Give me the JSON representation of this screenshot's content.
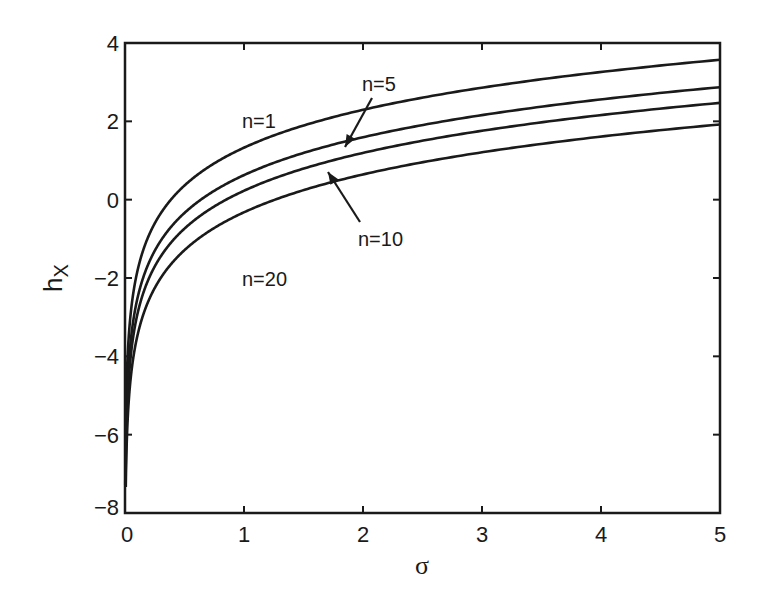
{
  "chart_data": {
    "type": "line",
    "title": "",
    "xlabel": "σ",
    "ylabel": "h_X",
    "ylabel_main": "h",
    "ylabel_sub": "X",
    "xlim": [
      0,
      5
    ],
    "ylim": [
      -8,
      4
    ],
    "xticks": [
      0,
      1,
      2,
      3,
      4,
      5
    ],
    "xtick_labels": [
      "0",
      "1",
      "2",
      "3",
      "4",
      "5"
    ],
    "yticks": [
      -8,
      -6,
      -4,
      -2,
      0,
      2,
      4
    ],
    "ytick_labels": [
      "−8",
      "−6",
      "−4",
      "−2",
      "0",
      "2",
      "4"
    ],
    "grid": false,
    "legend": "none (inline annotations)",
    "series": [
      {
        "name": "n=1",
        "x": [
          0.01,
          0.1,
          0.5,
          1,
          2,
          3,
          4,
          5
        ],
        "values": [
          -5.1,
          -1.9,
          0.4,
          1.35,
          2.3,
          2.85,
          3.25,
          3.55
        ]
      },
      {
        "name": "n=5",
        "x": [
          0.01,
          0.1,
          0.5,
          1,
          2,
          3,
          4,
          5
        ],
        "values": [
          -5.8,
          -2.6,
          -0.3,
          0.65,
          1.6,
          2.15,
          2.55,
          2.85
        ]
      },
      {
        "name": "n=10",
        "x": [
          0.01,
          0.1,
          0.5,
          1,
          2,
          3,
          4,
          5
        ],
        "values": [
          -6.2,
          -3.0,
          -0.7,
          0.25,
          1.2,
          1.75,
          2.15,
          2.45
        ]
      },
      {
        "name": "n=20",
        "x": [
          0.01,
          0.1,
          0.5,
          1,
          2,
          3,
          4,
          5
        ],
        "values": [
          -6.75,
          -3.55,
          -1.25,
          -0.3,
          0.65,
          1.2,
          1.6,
          1.9
        ]
      }
    ],
    "annotations": [
      {
        "text": "n=1",
        "x": 1.0,
        "y": 1.95,
        "arrow": false
      },
      {
        "text": "n=5",
        "x": 2.0,
        "y": 2.95,
        "arrow": true,
        "arrow_to": [
          1.8,
          1.3
        ]
      },
      {
        "text": "n=10",
        "x": 2.0,
        "y": -1.05,
        "arrow": true,
        "arrow_to": [
          1.65,
          0.7
        ]
      },
      {
        "text": "n=20",
        "x": 1.0,
        "y": -2.25,
        "arrow": false
      }
    ],
    "line_color": "#1a1a1a"
  }
}
